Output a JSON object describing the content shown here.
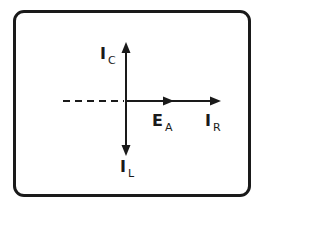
{
  "diagram": {
    "type": "phasor-diagram",
    "labels": {
      "ic": {
        "main": "I",
        "sub": "C"
      },
      "il": {
        "main": "I",
        "sub": "L"
      },
      "ea": {
        "main": "E",
        "sub": "A"
      },
      "ir": {
        "main": "I",
        "sub": "R"
      }
    },
    "vectors": [
      {
        "name": "I_C",
        "direction": "up"
      },
      {
        "name": "I_L",
        "direction": "down"
      },
      {
        "name": "E_A",
        "direction": "right"
      },
      {
        "name": "I_R",
        "direction": "right"
      }
    ],
    "reference_line": "dashed-left",
    "colors": {
      "stroke": "#1a1a1a",
      "background": "#ffffff"
    }
  }
}
